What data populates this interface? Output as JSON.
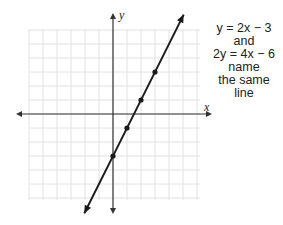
{
  "chart_data": {
    "type": "line",
    "title": "",
    "xlabel": "x",
    "ylabel": "y",
    "grid": true,
    "xlim": [
      -6,
      6
    ],
    "ylim": [
      -6,
      6
    ],
    "series": [
      {
        "name": "y = 2x - 3",
        "equation": "y = 2x - 3",
        "slope": 2,
        "intercept": -3,
        "marked_points": [
          [
            0,
            -3
          ],
          [
            1,
            -1
          ],
          [
            2,
            1
          ],
          [
            3,
            3
          ]
        ]
      }
    ],
    "annotations": [
      "y = 2x − 3",
      "and",
      "2y = 4x − 6",
      "name",
      "the same",
      "line"
    ]
  },
  "axes": {
    "x_label": "x",
    "y_label": "y"
  },
  "caption": {
    "lines": [
      "y = 2x − 3",
      "and",
      "2y = 4x − 6",
      "name",
      "the same",
      "line"
    ]
  },
  "colors": {
    "grid": "#e2e2e2",
    "axis": "#333333",
    "line": "#1a1a1a",
    "text": "#222222"
  }
}
